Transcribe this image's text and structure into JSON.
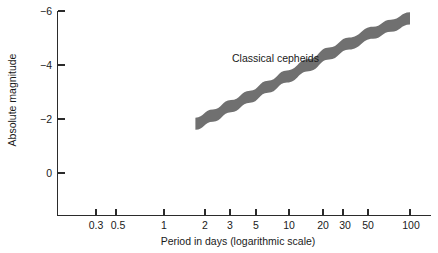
{
  "chart_data": {
    "type": "area",
    "title": "",
    "xlabel": "Period in days (logarithmic scale)",
    "ylabel": "Absolute magnitude",
    "xscale": "log",
    "xlim": [
      0.22,
      138
    ],
    "ylim": [
      0.9,
      -6.3
    ],
    "y_inverted": true,
    "grid": false,
    "legend": "none",
    "xticks": [
      0.3,
      0.5,
      1,
      2,
      3,
      5,
      10,
      20,
      30,
      50,
      100
    ],
    "xtick_labels": [
      "0.3",
      "0.5",
      "1",
      "2",
      "3",
      "5",
      "10",
      "20",
      "30",
      "50",
      "100"
    ],
    "yticks": [
      -6,
      -4,
      -2,
      0
    ],
    "ytick_labels": [
      "−6",
      "−4",
      "−2",
      "0"
    ],
    "series": [
      {
        "name": "Classical cepheids",
        "type": "band",
        "color": "#707070",
        "annotation": "Classical cepheids",
        "x": [
          1.8,
          2.5,
          3.5,
          5,
          7,
          10,
          15,
          22,
          32,
          50,
          70,
          100
        ],
        "y_upper": [
          -2.05,
          -2.35,
          -2.7,
          -3.05,
          -3.42,
          -3.8,
          -4.22,
          -4.65,
          -5.02,
          -5.42,
          -5.68,
          -5.95
        ],
        "y_lower": [
          -1.6,
          -1.9,
          -2.25,
          -2.6,
          -2.97,
          -3.35,
          -3.77,
          -4.2,
          -4.57,
          -4.97,
          -5.23,
          -5.5
        ],
        "y_center": [
          -1.82,
          -2.12,
          -2.47,
          -2.82,
          -3.19,
          -3.57,
          -3.99,
          -4.42,
          -4.79,
          -5.19,
          -5.45,
          -5.72
        ]
      }
    ]
  },
  "colors": {
    "band": "#707070",
    "axis": "#2b2b2b",
    "text": "#1a1a1a",
    "background": "#ffffff"
  }
}
